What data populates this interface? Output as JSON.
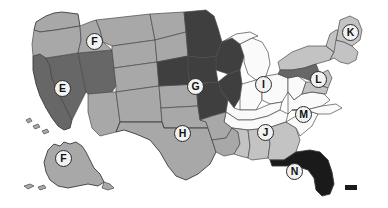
{
  "map": {
    "title": "United States choropleth map",
    "background_color": "#ffffff",
    "border_color": "#4a4a4a",
    "shades": {
      "darkest": "#1a1a1a",
      "dark": "#676767",
      "medium": "#a8a8a8",
      "light": "#c3c3c3",
      "lightest": "#f2f2f2"
    },
    "markers": [
      {
        "label": "E",
        "region": "nevada",
        "x": 62,
        "y": 88
      },
      {
        "label": "F",
        "region": "idaho",
        "x": 94,
        "y": 41
      },
      {
        "label": "F",
        "region": "alaska",
        "x": 63,
        "y": 158
      },
      {
        "label": "G",
        "region": "iowa",
        "x": 195,
        "y": 86
      },
      {
        "label": "H",
        "region": "texas-oklahoma",
        "x": 182,
        "y": 133
      },
      {
        "label": "I",
        "region": "indiana",
        "x": 263,
        "y": 84
      },
      {
        "label": "J",
        "region": "alabama",
        "x": 265,
        "y": 132
      },
      {
        "label": "K",
        "region": "maine",
        "x": 350,
        "y": 32
      },
      {
        "label": "L",
        "region": "pennsylvania",
        "x": 318,
        "y": 79
      },
      {
        "label": "M",
        "region": "north-carolina",
        "x": 303,
        "y": 114
      },
      {
        "label": "N",
        "region": "florida",
        "x": 294,
        "y": 171
      }
    ],
    "legend_swatch": {
      "name": "hawaii-marker",
      "color": "#1a1a1a",
      "x": 345,
      "y": 185,
      "width": 12,
      "height": 5
    }
  }
}
